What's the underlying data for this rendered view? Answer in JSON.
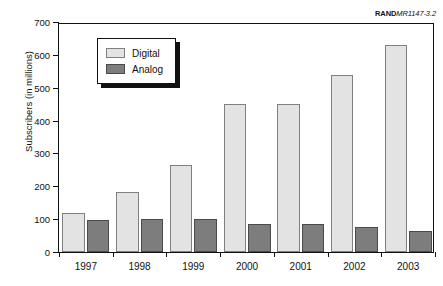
{
  "figure": {
    "source_id_bold": "RAND",
    "source_id_italic": "MR1147-3.2"
  },
  "chart_data": {
    "type": "bar",
    "title": "",
    "xlabel": "",
    "ylabel": "Subscribers (in millions)",
    "categories": [
      "1997",
      "1998",
      "1999",
      "2000",
      "2001",
      "2002",
      "2003"
    ],
    "series": [
      {
        "name": "Digital",
        "color": "#e3e3e3",
        "values": [
          120,
          183,
          265,
          450,
          450,
          540,
          630
        ]
      },
      {
        "name": "Analog",
        "color": "#7d7d7d",
        "values": [
          98,
          100,
          100,
          85,
          85,
          75,
          63
        ]
      }
    ],
    "ylim": [
      0,
      700
    ],
    "ytick_values": [
      0,
      100,
      200,
      300,
      400,
      500,
      600,
      700
    ],
    "ytick_labels": [
      "0",
      "100",
      "200",
      "300",
      "400",
      "500",
      "600",
      "700"
    ],
    "grid": false,
    "legend_position": "top-left",
    "legend_entries": [
      "Digital",
      "Analog"
    ]
  }
}
